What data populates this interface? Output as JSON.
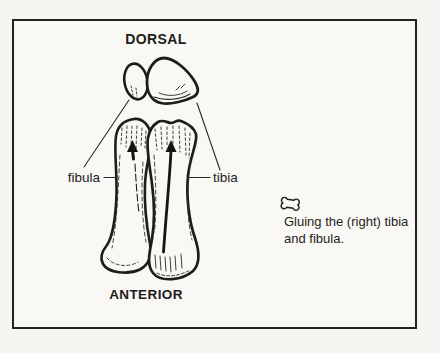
{
  "figure": {
    "type": "anatomical-diagram",
    "paper_color": "#f9f8f4",
    "ink_color": "#1d1d1b",
    "labels": {
      "dorsal": "DORSAL",
      "anterior": "ANTERIOR",
      "fibula": "fibula",
      "tibia": "tibia"
    },
    "caption": {
      "icon": "bone-icon",
      "line1": "Gluing the (right) tibia",
      "line2": "and fibula."
    },
    "parts": [
      "fibula-head-cross-section",
      "tibia-plateau-cross-section",
      "fibula-shaft",
      "tibia-shaft",
      "up-arrow-fibula",
      "up-arrow-tibia"
    ]
  }
}
